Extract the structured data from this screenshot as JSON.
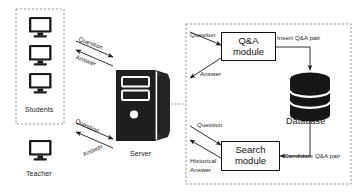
{
  "diagram": {
    "groups": {
      "clients_box": "clients-boundary",
      "server_side_box": "server-side-boundary"
    },
    "nodes": {
      "students": {
        "label": "Students",
        "icon": "monitor-icon",
        "count": 3
      },
      "teacher": {
        "label": "Teacher",
        "icon": "monitor-icon",
        "count": 1
      },
      "server": {
        "label": "Server",
        "icon": "server-tower-icon"
      },
      "qa_module": {
        "line1": "Q&A",
        "line2": "module"
      },
      "search_module": {
        "line1": "Search",
        "line2": "module"
      },
      "database": {
        "label": "Database",
        "icon": "database-cylinder-icon"
      }
    },
    "edges": {
      "students_question": "Question",
      "students_answer": "Answer",
      "teacher_question": "Question",
      "teacher_answer": "Answer",
      "qa_question": "Question",
      "qa_answer": "Answer",
      "insert_pair": "Insert Q&A pair",
      "search_question": "Question",
      "historical_answer_l1": "Historical",
      "historical_answer_l2": "Answer",
      "candidate_pair": "Candidate Q&A pair"
    },
    "colors": {
      "ink": "#111111",
      "icon_fill": "#1b1b1b",
      "background": "#ffffff",
      "boundary": "#8a8a8a"
    }
  }
}
